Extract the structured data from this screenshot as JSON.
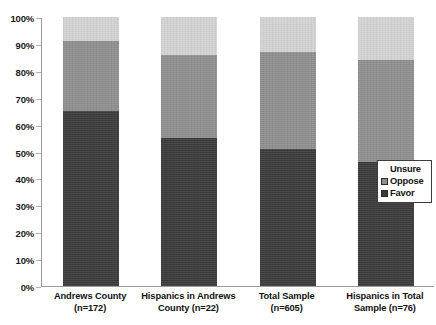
{
  "chart_data": {
    "type": "bar",
    "subtype": "stacked-100-percent",
    "title": "",
    "xlabel": "",
    "ylabel": "",
    "ylim": [
      0,
      100
    ],
    "grid": false,
    "legend_position": "right-inside",
    "categories": [
      "Andrews County (n=172)",
      "Hispanics in Andrews County (n=22)",
      "Total Sample (n=605)",
      "Hispanics in Total Sample (n=76)"
    ],
    "category_lines": [
      [
        "Andrews County",
        "(n=172)"
      ],
      [
        "Hispanics in Andrews",
        "County (n=22)"
      ],
      [
        "Total Sample",
        "(n=605)"
      ],
      [
        "Hispanics in Total",
        "Sample (n=76)"
      ]
    ],
    "series": [
      {
        "name": "Favor",
        "color": "#3a3a3a",
        "values": [
          65,
          55,
          51,
          46
        ]
      },
      {
        "name": "Oppose",
        "color": "#8e8e8e",
        "values": [
          26,
          31,
          36,
          38
        ]
      },
      {
        "name": "Unsure",
        "color": "#d2d2d2",
        "values": [
          9,
          14,
          13,
          16
        ]
      }
    ],
    "ytick_labels": [
      "100%",
      "90%",
      "80%",
      "70%",
      "60%",
      "50%",
      "40%",
      "30%",
      "20%",
      "10%",
      "0%"
    ],
    "ytick_values": [
      100,
      90,
      80,
      70,
      60,
      50,
      40,
      30,
      20,
      10,
      0
    ]
  },
  "legend": {
    "entries": [
      {
        "label": "Unsure",
        "color": "#d2d2d2"
      },
      {
        "label": "Oppose",
        "color": "#8e8e8e"
      },
      {
        "label": "Favor",
        "color": "#3a3a3a"
      }
    ]
  }
}
